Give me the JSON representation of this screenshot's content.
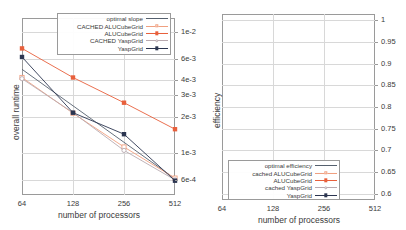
{
  "figure": {
    "panels": [
      "runtime",
      "efficiency"
    ],
    "background": "#ffffff",
    "colors": {
      "optimal": "#55606e",
      "cached_alu": "#f0a080",
      "alu": "#e8603c",
      "cached_yasp": "#b9aab0",
      "yasp": "#2b3550",
      "grid": "#d8d8d8",
      "frame": "#9a9a9a"
    }
  },
  "chart_data": [
    {
      "id": "runtime",
      "type": "line",
      "title": "",
      "xlabel": "number of processors",
      "ylabel": "overall runtime",
      "xscale": "log2",
      "yscale": "log",
      "x": [
        64,
        128,
        256,
        512
      ],
      "xticks": [
        "64",
        "128",
        "256",
        "512"
      ],
      "yticks": [
        "1e-2",
        "6e-3",
        "4e-3",
        "3e-3",
        "2e-3",
        "1e-3",
        "6e-4"
      ],
      "ytick_values": [
        0.01,
        0.006,
        0.004,
        0.003,
        0.002,
        0.001,
        0.0006
      ],
      "ylim": [
        0.00045,
        0.013
      ],
      "grid": true,
      "legend_position": "top-right",
      "series": [
        {
          "name": "optimal slope",
          "marker": "none",
          "line": "solid",
          "values": [
            0.0049,
            0.00245,
            0.001225,
            0.000613
          ]
        },
        {
          "name": "CACHED ALUCubeGrid",
          "marker": "open-square",
          "line": "solid",
          "values": [
            0.0042,
            0.00213,
            0.00112,
            0.00062
          ]
        },
        {
          "name": "ALUCubeGrid",
          "marker": "filled-square",
          "line": "solid",
          "values": [
            0.0073,
            0.0042,
            0.0026,
            0.00157
          ]
        },
        {
          "name": "CACHED YaspGrid",
          "marker": "open-circle",
          "line": "solid",
          "values": [
            0.0041,
            0.00215,
            0.00105,
            0.0006
          ]
        },
        {
          "name": "YaspGrid",
          "marker": "filled-square",
          "line": "solid",
          "values": [
            0.0062,
            0.00215,
            0.00143,
            0.00059
          ]
        }
      ]
    },
    {
      "id": "efficiency",
      "type": "line",
      "title": "",
      "xlabel": "number of processors",
      "ylabel": "efficiency",
      "xscale": "log2",
      "yscale": "linear",
      "x": [
        64,
        128,
        256,
        512
      ],
      "xticks": [
        "64",
        "128",
        "256",
        "512"
      ],
      "yticks": [
        "1",
        "0.95",
        "0.9",
        "0.85",
        "0.8",
        "0.75",
        "0.7",
        "0.65",
        "0.6"
      ],
      "ytick_values": [
        1,
        0.95,
        0.9,
        0.85,
        0.8,
        0.75,
        0.7,
        0.65,
        0.6
      ],
      "ylim": [
        0.585,
        1.015
      ],
      "grid": true,
      "legend_position": "bottom-left",
      "series": [
        {
          "name": "optimal efficiency",
          "marker": "none",
          "line": "solid",
          "values": [
            1.0,
            1.0,
            1.0,
            1.0
          ]
        },
        {
          "name": "cached  ALUCubeGrid",
          "marker": "open-square",
          "line": "solid",
          "values": [
            1.0,
            0.988,
            0.977,
            0.873
          ]
        },
        {
          "name": "ALUCubeGrid",
          "marker": "filled-square",
          "line": "solid",
          "values": [
            1.0,
            0.822,
            0.715,
            0.618
          ]
        },
        {
          "name": "cached YaspGrid",
          "marker": "open-circle",
          "line": "solid",
          "values": [
            1.0,
            0.958,
            0.918,
            0.877
          ]
        },
        {
          "name": "YaspGrid",
          "marker": "filled-square",
          "line": "solid",
          "values": [
            1.0,
            0.888,
            0.944,
            0.896
          ]
        }
      ]
    }
  ],
  "left_chart": {
    "ylabel": "overall runtime",
    "xlabel": "number of processors",
    "legend": [
      {
        "label": "optimal slope"
      },
      {
        "label": "CACHED ALUCubeGrid"
      },
      {
        "label": "ALUCubeGrid"
      },
      {
        "label": "CACHED         YaspGrid"
      },
      {
        "label": "YaspGrid"
      }
    ],
    "yticks": [
      "1e-2",
      "6e-3",
      "4e-3",
      "3e-3",
      "2e-3",
      "1e-3",
      "6e-4"
    ],
    "xticks": [
      "64",
      "128",
      "256",
      "512"
    ]
  },
  "right_chart": {
    "ylabel": "efficiency",
    "xlabel": "number of processors",
    "legend": [
      {
        "label": "optimal efficiency"
      },
      {
        "label": "cached  ALUCubeGrid"
      },
      {
        "label": "ALUCubeGrid"
      },
      {
        "label": "cached YaspGrid"
      },
      {
        "label": "YaspGrid"
      }
    ],
    "yticks": [
      "1",
      "0.95",
      "0.9",
      "0.85",
      "0.8",
      "0.75",
      "0.7",
      "0.65",
      "0.6"
    ],
    "xticks": [
      "64",
      "128",
      "256",
      "512"
    ]
  }
}
